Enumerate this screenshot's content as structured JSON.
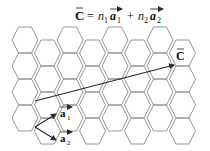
{
  "title": {
    "lhs": "C",
    "eq": "=",
    "n1": "n",
    "sub1": "1",
    "a1": "a",
    "a1sub": "1",
    "plus": "+",
    "n2": "n",
    "sub2": "2",
    "a2": "a",
    "a2sub": "2"
  },
  "labels": {
    "chiral_vector": "C",
    "a1": "a",
    "a1_sub": "1",
    "a2": "a",
    "a2_sub": "2"
  },
  "colors": {
    "lattice": "#8a8a8a",
    "vector": "#2a2a2a",
    "text": "#111111"
  },
  "lattice": {
    "type": "hexagonal (flat-top)",
    "columns": 8,
    "hex_width": 27,
    "hex_height": 26
  },
  "vectors": {
    "C": {
      "from": [
        35,
        101
      ],
      "to": [
        174,
        65
      ]
    },
    "a1": {
      "from": [
        35,
        127
      ],
      "to": [
        56,
        114
      ]
    },
    "a2": {
      "from": [
        35,
        127
      ],
      "to": [
        56,
        140
      ]
    }
  }
}
